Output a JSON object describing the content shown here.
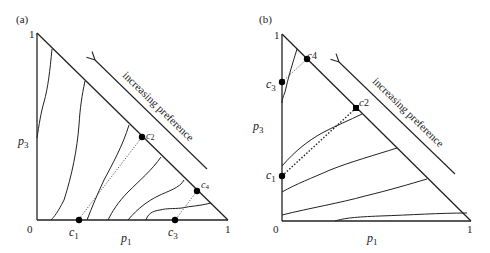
{
  "panels": [
    {
      "id": "a",
      "label": "(a)",
      "x_axis_label": "p",
      "x_axis_sub": "1",
      "y_axis_label": "p",
      "y_axis_sub": "3",
      "origin_label": "0",
      "x_max_label": "1",
      "y_max_label": "1",
      "arrow_text": "increasing preference",
      "points": [
        {
          "name": "c",
          "sub": "1"
        },
        {
          "name": "c",
          "sub": "2"
        },
        {
          "name": "c",
          "sub": "3"
        },
        {
          "name": "c",
          "sub": "4"
        }
      ]
    },
    {
      "id": "b",
      "label": "(b)",
      "x_axis_label": "p",
      "x_axis_sub": "1",
      "y_axis_label": "p",
      "y_axis_sub": "3",
      "origin_label": "0",
      "x_max_label": "1",
      "y_max_label": "1",
      "arrow_text": "increasing preference",
      "points": [
        {
          "name": "c",
          "sub": "1"
        },
        {
          "name": "c",
          "sub": "2"
        },
        {
          "name": "c",
          "sub": "3"
        },
        {
          "name": "c",
          "sub": "4"
        }
      ]
    }
  ]
}
